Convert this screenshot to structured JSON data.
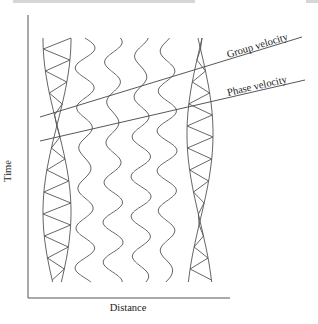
{
  "header": {
    "clipped_text": ""
  },
  "figure": {
    "x_axis_label": "Distance",
    "y_axis_label": "Time",
    "lines": [
      {
        "name": "group-velocity",
        "label": "Group velocity"
      },
      {
        "name": "phase-velocity",
        "label": "Phase velocity"
      }
    ],
    "wave_columns": 6
  }
}
